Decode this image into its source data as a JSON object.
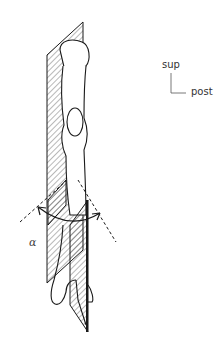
{
  "figure": {
    "labels": {
      "orientation_superior": "sup",
      "orientation_posterior": "post",
      "angle": "α"
    },
    "colors": {
      "line": "#1a1a1a",
      "background": "#ffffff"
    }
  }
}
